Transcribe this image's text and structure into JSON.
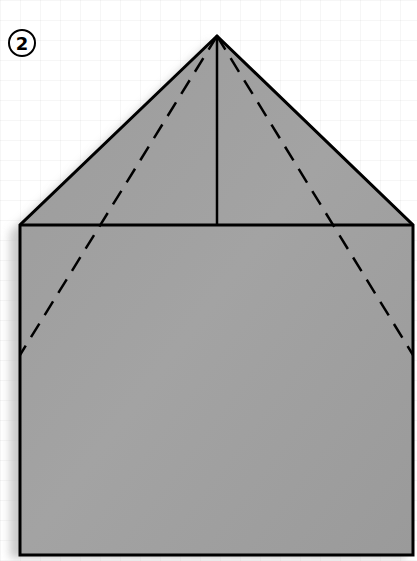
{
  "diagram": {
    "type": "origami-fold-step",
    "step_number": "2",
    "colors": {
      "paper": "#9a9a9a",
      "paper_light": "#a6a6a6",
      "outline": "#000000",
      "background": "#ffffff",
      "shadow": "#c8c8c8"
    },
    "shape": {
      "apex": [
        217,
        36
      ],
      "square_top_left": [
        20,
        225
      ],
      "square_top_right": [
        413,
        225
      ],
      "square_bottom_left": [
        20,
        555
      ],
      "square_bottom_right": [
        413,
        555
      ]
    },
    "lines": {
      "center_crease": {
        "style": "solid",
        "from": [
          217,
          36
        ],
        "to": [
          217,
          225
        ]
      },
      "top_edge": {
        "style": "solid",
        "from": [
          20,
          225
        ],
        "to": [
          413,
          225
        ]
      },
      "left_valley_fold": {
        "style": "dashed",
        "from": [
          217,
          36
        ],
        "to": [
          20,
          355
        ]
      },
      "right_valley_fold": {
        "style": "dashed",
        "from": [
          217,
          36
        ],
        "to": [
          413,
          355
        ]
      }
    }
  }
}
